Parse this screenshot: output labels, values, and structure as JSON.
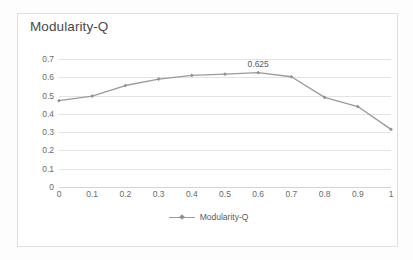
{
  "chart_data": {
    "type": "line",
    "title": "Modularity-Q",
    "xlabel": "",
    "ylabel": "",
    "categories": [
      "0",
      "0.1",
      "0.2",
      "0.3",
      "0.4",
      "0.5",
      "0.6",
      "0.7",
      "0.8",
      "0.9",
      "1"
    ],
    "series": [
      {
        "name": "Modularity-Q",
        "values": [
          0.472,
          0.497,
          0.555,
          0.59,
          0.61,
          0.617,
          0.625,
          0.603,
          0.49,
          0.44,
          0.315
        ]
      }
    ],
    "ylim": [
      0,
      0.7
    ],
    "y_ticks": [
      "0.7",
      "0.6",
      "0.5",
      "0.4",
      "0.3",
      "0.2",
      "0.1",
      "0"
    ],
    "y_tick_values": [
      0.7,
      0.6,
      0.5,
      0.4,
      0.3,
      0.2,
      0.1,
      0
    ],
    "grid": true,
    "legend_position": "bottom",
    "annotations": [
      {
        "text": "0.625",
        "category": "0.6",
        "value": 0.625
      }
    ],
    "colors": {
      "line": "#9a9a9a",
      "marker": "#8f8f8f",
      "gridline": "#e3e3e3",
      "axis": "#d4d4d4",
      "text": "#6b6b6b",
      "title_text": "#4a4a4a",
      "plot_background": "#ffffff",
      "frame_border": "#e0e0e0",
      "page_background": "#fdfdfd"
    }
  },
  "legend": {
    "entries": [
      {
        "label": "Modularity-Q",
        "marker": "diamond-marker-icon"
      }
    ]
  }
}
